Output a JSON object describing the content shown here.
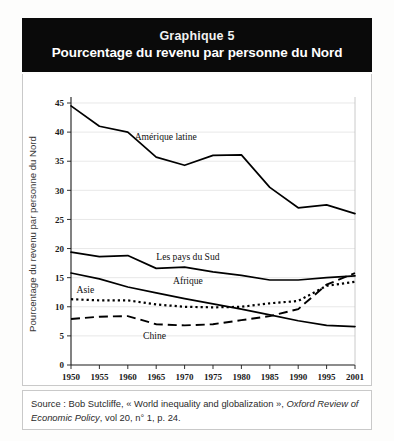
{
  "figure": {
    "title_number": "Graphique 5",
    "title_main": "Pourcentage du revenu par personne du Nord",
    "source_prefix": "Source : Bob Sutcliffe, « World inequality and globalization », ",
    "source_italic": "Oxford Review of Economic Policy",
    "source_suffix": ", vol 20, n° 1, p. 24."
  },
  "chart_data": {
    "type": "line",
    "title": "Pourcentage du revenu par personne du Nord",
    "subtitle": "Graphique 5",
    "xlabel": "",
    "ylabel": "Pourcentage du revenu par personne du Nord",
    "xlim": [
      1950,
      2001
    ],
    "ylim": [
      0,
      45
    ],
    "grid": true,
    "legend_position": "inline-annotations",
    "x": [
      1950,
      1955,
      1960,
      1965,
      1970,
      1975,
      1980,
      1985,
      1990,
      1995,
      2001
    ],
    "xticklabels": [
      "1950",
      "1955",
      "1960",
      "1965",
      "1970",
      "1975",
      "1980",
      "1985",
      "1990",
      "1995",
      "2001"
    ],
    "yticks": [
      0,
      5,
      10,
      15,
      20,
      25,
      30,
      35,
      40,
      45
    ],
    "yticklabels": [
      "0",
      "5",
      "10",
      "15",
      "20",
      "25",
      "30",
      "35",
      "40",
      "45"
    ],
    "series": [
      {
        "name": "Amérique latine",
        "style": "solid",
        "values": [
          44.5,
          41.0,
          40.0,
          35.7,
          34.3,
          36.0,
          36.1,
          30.5,
          27.0,
          27.5,
          26.0
        ],
        "label_x": 1967,
        "label_y": 38.6
      },
      {
        "name": "Les pays du Sud",
        "style": "solid",
        "values": [
          19.4,
          18.6,
          18.8,
          16.6,
          16.8,
          16.0,
          15.4,
          14.6,
          14.6,
          15.0,
          15.3
        ],
        "label_x": 1971,
        "label_y": 18.1
      },
      {
        "name": "Afrique",
        "style": "solid",
        "values": [
          15.8,
          14.8,
          13.4,
          12.4,
          11.4,
          10.5,
          9.6,
          8.6,
          7.6,
          6.8,
          6.6
        ],
        "label_x": 1971,
        "label_y": 13.9
      },
      {
        "name": "Asie",
        "style": "dotted",
        "values": [
          11.3,
          11.1,
          11.1,
          10.4,
          10.0,
          9.9,
          10.0,
          10.6,
          11.0,
          13.6,
          14.3
        ],
        "label_x": 1951,
        "label_y": 12.3
      },
      {
        "name": "Chine",
        "style": "dashed",
        "values": [
          7.9,
          8.3,
          8.4,
          7.0,
          6.8,
          7.0,
          7.7,
          8.4,
          9.6,
          13.8,
          15.8
        ],
        "label_x": 1965,
        "label_y": 4.4
      }
    ]
  },
  "colors": {
    "header_bg": "#0a0a0a",
    "header_text": "#ffffff",
    "line": "#000000",
    "grid": "#d8d8d8",
    "frame": "#c9c9c9",
    "caption_text": "#2b2b2b"
  }
}
